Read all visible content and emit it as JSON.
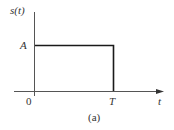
{
  "diagram": {
    "type": "rectangular-pulse",
    "y_axis_label": "s(t)",
    "x_axis_label": "t",
    "amplitude_label": "A",
    "origin_label": "0",
    "end_label": "T",
    "caption": "(a)",
    "colors": {
      "line": "#1a1a1a",
      "text": "#333333"
    }
  }
}
